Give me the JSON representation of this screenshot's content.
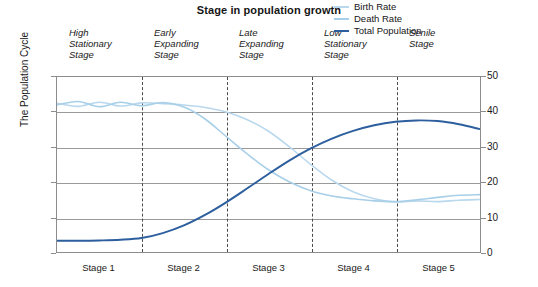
{
  "chart_data": {
    "type": "line",
    "title": "Stage in population growth",
    "xlabel": "",
    "ylabel": "The Population Cycle",
    "ylim": [
      0,
      50
    ],
    "yticks": [
      0,
      10,
      20,
      30,
      40,
      50
    ],
    "grid": true,
    "dual_axis": true,
    "legend_position": "top-right",
    "stage_labels_top": [
      "High\nStationary\nStage",
      "Early\nExpanding\nStage",
      "Late\nExpanding\nStage",
      "Low\nStationary\nStage",
      "Senile\nStage"
    ],
    "stage_labels_bottom": [
      "Stage 1",
      "Stage 2",
      "Stage 3",
      "Stage 4",
      "Stage 5"
    ],
    "stage_boundaries": [
      20,
      40,
      60,
      80
    ],
    "x": [
      0,
      5,
      10,
      15,
      20,
      25,
      30,
      35,
      40,
      45,
      50,
      55,
      60,
      65,
      70,
      75,
      80,
      85,
      90,
      95,
      100
    ],
    "series": [
      {
        "name": "Birth Rate",
        "color": "#b9d8ee",
        "values": [
          42.5,
          41.6,
          42.8,
          41.7,
          42.6,
          42.4,
          42.0,
          41.3,
          40.0,
          37.8,
          34.5,
          30.0,
          25.0,
          20.5,
          17.2,
          15.2,
          14.3,
          14.6,
          14.4,
          14.8,
          15.0
        ]
      },
      {
        "name": "Death Rate",
        "color": "#a8cfe8",
        "values": [
          42.0,
          43.0,
          41.5,
          42.8,
          41.8,
          42.7,
          41.4,
          38.0,
          33.0,
          28.0,
          23.5,
          20.0,
          17.5,
          16.0,
          15.2,
          14.6,
          14.4,
          14.9,
          15.6,
          16.2,
          16.4
        ]
      },
      {
        "name": "Total Population",
        "color": "#2d5f9e",
        "values": [
          3.2,
          3.2,
          3.3,
          3.5,
          4.0,
          5.4,
          7.6,
          10.6,
          14.2,
          18.2,
          22.3,
          26.2,
          29.6,
          32.4,
          34.6,
          36.2,
          37.2,
          37.6,
          37.4,
          36.5,
          35.1
        ]
      }
    ]
  },
  "legend": {
    "items": [
      {
        "label": "Birth Rate",
        "color": "#b9d8ee"
      },
      {
        "label": "Death Rate",
        "color": "#a8cfe8"
      },
      {
        "label": "Total Population",
        "color": "#2d5f9e"
      }
    ]
  }
}
